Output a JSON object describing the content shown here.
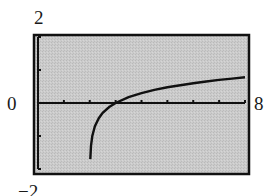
{
  "window": {
    "xmin_label": "0",
    "xmax_label": "8",
    "ymin_label": "−2",
    "ymax_label": "2",
    "xmin": 0,
    "xmax": 8,
    "xscl": 1,
    "ymin": -2,
    "ymax": 2,
    "yscl": 1
  },
  "colors": {
    "screen_bg": "#c8c8c8",
    "frame": "#111111",
    "curve": "#111111",
    "axis": "#111111"
  },
  "chart_data": {
    "type": "line",
    "title": "",
    "xlabel": "",
    "ylabel": "",
    "xlim": [
      0,
      8
    ],
    "ylim": [
      -2,
      2
    ],
    "grid": false,
    "tick_labels": {
      "x": [
        "0",
        "8"
      ],
      "y": [
        "-2",
        "2"
      ]
    },
    "x_ticks": [
      1,
      2,
      3,
      4,
      5,
      6,
      7,
      8
    ],
    "y_ticks": [
      -2,
      -1,
      1,
      2
    ],
    "annotations": [],
    "series": [
      {
        "name": "y = log(x - 2)",
        "x": [
          2.02,
          2.05,
          2.1,
          2.2,
          2.35,
          2.5,
          2.75,
          3.0,
          3.5,
          4.0,
          4.5,
          5.0,
          5.5,
          6.0,
          6.5,
          7.0,
          7.5,
          8.0
        ],
        "y": [
          -1.7,
          -1.3,
          -1.0,
          -0.7,
          -0.46,
          -0.3,
          -0.12,
          0.0,
          0.18,
          0.3,
          0.4,
          0.48,
          0.54,
          0.6,
          0.65,
          0.7,
          0.74,
          0.78
        ]
      }
    ]
  }
}
